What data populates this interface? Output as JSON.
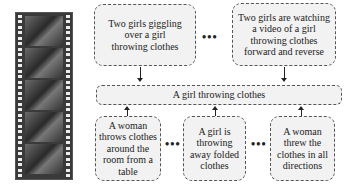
{
  "film_strip": {
    "frame_count": 5,
    "description": "video frames of a girl throwing clothes"
  },
  "top_captions": [
    {
      "text": "Two girls giggling over a girl throwing clothes"
    },
    {
      "text": "Two girls are watching a video of a girl throwing clothes forward and reverse"
    }
  ],
  "center_caption": {
    "text": "A girl throwing clothes"
  },
  "bottom_captions": [
    {
      "text": "A woman throws clothes around the room from a table"
    },
    {
      "text": "A girl is throwing away folded clothes"
    },
    {
      "text": "A woman threw the clothes in all directions"
    }
  ],
  "ellipsis": "•••",
  "colors": {
    "box_fill": "#f2f2f2",
    "border": "#555555",
    "film": "#3a3a3a"
  }
}
